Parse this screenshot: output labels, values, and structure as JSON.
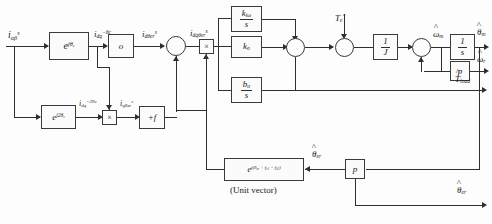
{
  "diagram": {
    "caption": "(Unit vector)",
    "line_color": "#2f2f2f",
    "block_border_color": "#3a3a3a",
    "background": "#fdfdfd"
  },
  "blocks": {
    "rotation_fwd": {
      "label": "e",
      "exp": "jθ",
      "exp_sub": "c",
      "name": "e^(jθc)"
    },
    "filter_o": {
      "label": "o"
    },
    "rotation_neg": {
      "label": "e",
      "exp": "j2θ",
      "exp_sub": "c",
      "name": "e^(j2θc)"
    },
    "plus_f": {
      "label": "+f"
    },
    "k_io": {
      "num": "k",
      "num_sub": "iω",
      "den": "s"
    },
    "k_o": {
      "label": "k",
      "sub": "o"
    },
    "b_o": {
      "num": "b",
      "num_sub": "o",
      "den": "s"
    },
    "one_over_J": {
      "num": "1",
      "den": "J"
    },
    "one_over_s": {
      "num": "1",
      "den": "s"
    },
    "pole_pairs": {
      "label": "p"
    },
    "pole_pairs_2": {
      "label": "p"
    },
    "unit_vector": {
      "label": "e",
      "exp": "j(θ",
      "exp_sub": "er",
      "exp_rest": " + f",
      "exp_rest_sub": "s1",
      "exp_tail": " − f",
      "exp_tail_sub": "s2",
      "exp_close": ")"
    }
  },
  "operators": {
    "sum_input": "○",
    "multiplier_demod": "×",
    "multiplier_lower": "×",
    "sum_torque": "○",
    "sum_speed": "○",
    "sum_omega": "○"
  },
  "signals": {
    "i_alpha_beta": {
      "base": "i",
      "sub": "αβ",
      "sup": "s"
    },
    "i_dq": {
      "base": "i",
      "sub": "dq",
      "sup": "−θc"
    },
    "i_d_theta_er": {
      "base": "i",
      "sub": "dθer",
      "sup": "s"
    },
    "i_dq_theta_er": {
      "base": "i",
      "sub": "dqθer",
      "sup": "s"
    },
    "i_dq_2theta": {
      "base": "i",
      "sub": "dq",
      "sup": "−2θc"
    },
    "i_q_theta_er": {
      "base": "i",
      "sub": "qθer",
      "sup": "s"
    },
    "torque_ref": {
      "base": "T",
      "sub": "e",
      "sup": "*"
    },
    "omega_m_hat": {
      "base": "ω",
      "sub": "m",
      "hat": true
    },
    "theta_m_hat": {
      "base": "θ",
      "sub": "m",
      "hat": true
    },
    "omega_r_hat": {
      "base": "ω",
      "sub": "r",
      "hat": true
    },
    "T_load_hat": {
      "base": "T",
      "sub": "load",
      "hat": true
    },
    "theta_er_hat": {
      "base": "θ",
      "sub": "er",
      "hat": true
    },
    "theta_er_hat_out": {
      "base": "θ",
      "sub": "er",
      "hat": true
    }
  }
}
